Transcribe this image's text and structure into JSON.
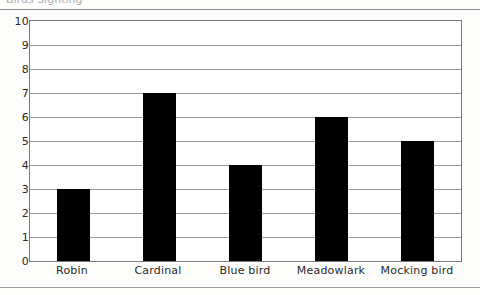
{
  "header": {
    "clipped_title": "Birds Sighting"
  },
  "chart_data": {
    "type": "bar",
    "title": "Birds Sighting",
    "xlabel": "",
    "ylabel": "",
    "categories": [
      "Robin",
      "Cardinal",
      "Blue bird",
      "Meadowlark",
      "Mocking bird"
    ],
    "values": [
      3,
      7,
      4,
      6,
      5
    ],
    "ylim": [
      0,
      10
    ],
    "ytick_labels": [
      "0",
      "1",
      "2",
      "3",
      "4",
      "5",
      "6",
      "7",
      "8",
      "9",
      "10"
    ],
    "grid": true,
    "legend": false,
    "bar_color": "#000000",
    "grid_color": "#9b9b9b",
    "frame_color": "#7a7a7a"
  }
}
